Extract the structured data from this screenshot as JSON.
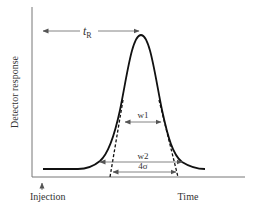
{
  "diagram": {
    "y_axis_label": "Detector response",
    "x_axis_label": "Time",
    "injection_label": "Injection",
    "retention_time_label": "t",
    "retention_time_subscript": "R",
    "width_half_height_label": "w1",
    "width_base_label": "w2",
    "sigma_width_label": "4σ",
    "colors": {
      "line": "#111111",
      "axis": "#777777",
      "arrow": "#666666",
      "text": "#333333"
    }
  }
}
